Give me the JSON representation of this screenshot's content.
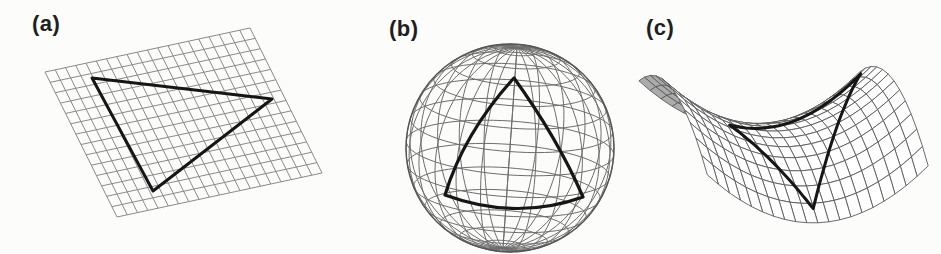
{
  "figure": {
    "background": "#fcfcfb",
    "ink_color": "#161616",
    "panels": [
      {
        "label": "(a)",
        "kind": "flat-plane",
        "grid": {
          "origin": [
            45,
            72
          ],
          "u_vec": [
            205,
            -44
          ],
          "v_vec": [
            72,
            145
          ],
          "u_cells": 20,
          "v_cells": 14,
          "color": "#8a8a8a",
          "width": 1
        },
        "triangle": {
          "points": [
            [
              92,
              78
            ],
            [
              272,
              99
            ],
            [
              153,
              191
            ]
          ],
          "color": "#161616",
          "width": 3
        }
      },
      {
        "label": "(b)",
        "kind": "sphere",
        "sphere": {
          "center": [
            510,
            148
          ],
          "radius": 104,
          "tilt_deg": 15,
          "spin_deg": 4,
          "lat_step_deg": 13,
          "lon_step_deg": 15,
          "color": "#6d6d6d",
          "width": 1,
          "outline_color": "#565656",
          "outline_width": 1.4
        },
        "triangle": {
          "segments": [
            {
              "from": [
                514,
                78
              ],
              "ctrl": [
                464,
                133
              ],
              "to": [
                445,
                195
              ]
            },
            {
              "from": [
                445,
                195
              ],
              "ctrl": [
                516,
                221
              ],
              "to": [
                583,
                197
              ]
            },
            {
              "from": [
                583,
                197
              ],
              "ctrl": [
                558,
                139
              ],
              "to": [
                514,
                78
              ]
            }
          ],
          "color": "#161616",
          "width": 3.2
        }
      },
      {
        "label": "(c)",
        "kind": "saddle",
        "saddle": {
          "center": [
            800,
            136
          ],
          "x_scale": 100,
          "depth_scale": 50,
          "z_scale": 38,
          "rot_deg": 20,
          "u_min": -1.35,
          "u_max": 1.0,
          "v_min": -1.0,
          "v_max": 1.0,
          "u_cells": 20,
          "v_cells": 12,
          "line_color": "#5a5a5a",
          "line_width": 0.9,
          "front_fill": "#ffffff",
          "back_fill": "#ababab"
        },
        "triangle": {
          "uv_points": [
            [
              0.93,
              -0.78
            ],
            [
              -0.18,
              0.88
            ],
            [
              -0.72,
              -0.08
            ]
          ],
          "color": "#161616",
          "width": 3
        }
      }
    ]
  }
}
